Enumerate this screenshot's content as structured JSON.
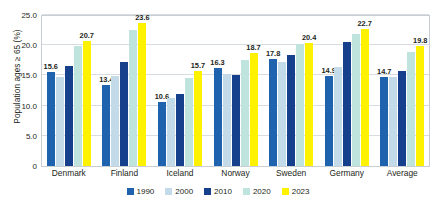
{
  "chart_data": {
    "type": "bar",
    "title": "",
    "xlabel": "",
    "ylabel": "Population ages ≥ 65 (%)",
    "ylim": [
      0,
      25
    ],
    "grid": true,
    "legend_position": "bottom",
    "categories": [
      "Denmark",
      "Finland",
      "Iceland",
      "Norway",
      "Sweden",
      "Germany",
      "Average"
    ],
    "ytick_labels": [
      "0",
      "5.0",
      "10.0",
      "15.0",
      "20.0",
      "25.0"
    ],
    "ytick_values": [
      0,
      5,
      10,
      15,
      20,
      25
    ],
    "series": [
      {
        "name": "1990",
        "color": "#1f62ad",
        "values": [
          15.6,
          13.4,
          10.6,
          16.3,
          17.8,
          14.9,
          14.7
        ],
        "labels": [
          "15.6",
          "13.4",
          "10.6",
          "16.3",
          "17.8",
          "14.9",
          "14.7"
        ]
      },
      {
        "name": "2000",
        "color": "#c3dbe8",
        "values": [
          14.8,
          14.9,
          11.2,
          15.2,
          17.3,
          16.4,
          14.7
        ],
        "labels": [
          "",
          "",
          "",
          "",
          "",
          "",
          ""
        ]
      },
      {
        "name": "2010",
        "color": "#163f8c",
        "values": [
          16.6,
          17.3,
          12.0,
          15.0,
          18.3,
          20.6,
          15.8
        ],
        "labels": [
          "",
          "",
          "",
          "",
          "",
          "",
          ""
        ]
      },
      {
        "name": "2020",
        "color": "#bfe3dd",
        "values": [
          19.9,
          22.6,
          14.5,
          17.5,
          20.2,
          21.8,
          18.8
        ],
        "labels": [
          "",
          "",
          "",
          "",
          "",
          "",
          ""
        ]
      },
      {
        "name": "2023",
        "color": "#fff200",
        "values": [
          20.7,
          23.6,
          15.7,
          18.7,
          20.4,
          22.7,
          19.8
        ],
        "labels": [
          "20.7",
          "23.6",
          "15.7",
          "18.7",
          "20.4",
          "22.7",
          "19.8"
        ]
      }
    ]
  },
  "legend": {
    "items": [
      {
        "label": "1990",
        "color": "#1f62ad"
      },
      {
        "label": "2000",
        "color": "#c3dbe8"
      },
      {
        "label": "2010",
        "color": "#163f8c"
      },
      {
        "label": "2020",
        "color": "#bfe3dd"
      },
      {
        "label": "2023",
        "color": "#fff200"
      }
    ]
  }
}
